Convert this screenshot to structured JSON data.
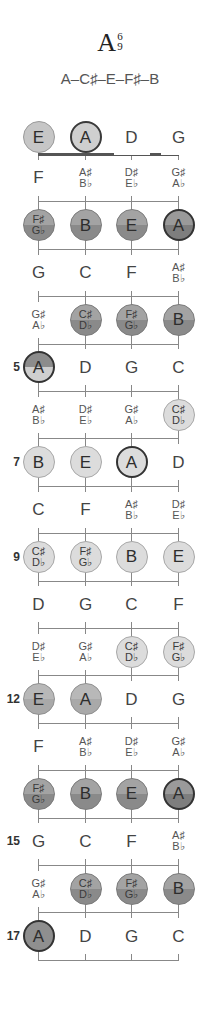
{
  "chord": {
    "root": "A",
    "ext_top": "6",
    "ext_bottom": "9",
    "notes_label": "A–C♯–E–F♯–B"
  },
  "strings": [
    "E",
    "A",
    "D",
    "G"
  ],
  "fret_numbers": [
    {
      "fret": 5,
      "label": "5"
    },
    {
      "fret": 7,
      "label": "7"
    },
    {
      "fret": 9,
      "label": "9"
    },
    {
      "fret": 12,
      "label": "12"
    },
    {
      "fret": 15,
      "label": "15"
    },
    {
      "fret": 17,
      "label": "17"
    }
  ],
  "rows": [
    {
      "fret": 0,
      "cells": [
        {
          "top": "E",
          "style": "open",
          "root": false
        },
        {
          "top": "A",
          "style": "open",
          "root": true
        },
        {
          "top": "D",
          "style": "plain"
        },
        {
          "top": "G",
          "style": "plain"
        }
      ]
    },
    {
      "fret": 1,
      "cells": [
        {
          "top": "F",
          "style": "plain"
        },
        {
          "top": "A♯",
          "bottom": "B♭",
          "style": "plain"
        },
        {
          "top": "D♯",
          "bottom": "E♭",
          "style": "plain"
        },
        {
          "top": "G♯",
          "bottom": "A♭",
          "style": "plain"
        }
      ]
    },
    {
      "fret": 2,
      "cells": [
        {
          "top": "F♯",
          "bottom": "G♭",
          "style": "dark"
        },
        {
          "top": "B",
          "style": "dark"
        },
        {
          "top": "E",
          "style": "dark"
        },
        {
          "top": "A",
          "style": "dark",
          "root": true
        }
      ]
    },
    {
      "fret": 3,
      "cells": [
        {
          "top": "G",
          "style": "plain"
        },
        {
          "top": "C",
          "style": "plain"
        },
        {
          "top": "F",
          "style": "plain"
        },
        {
          "top": "A♯",
          "bottom": "B♭",
          "style": "plain"
        }
      ]
    },
    {
      "fret": 4,
      "cells": [
        {
          "top": "G♯",
          "bottom": "A♭",
          "style": "plain"
        },
        {
          "top": "C♯",
          "bottom": "D♭",
          "style": "dark"
        },
        {
          "top": "F♯",
          "bottom": "G♭",
          "style": "dark"
        },
        {
          "top": "B",
          "style": "dark"
        }
      ]
    },
    {
      "fret": 5,
      "cells": [
        {
          "top": "A",
          "style": "mid",
          "root": true
        },
        {
          "top": "D",
          "style": "plain"
        },
        {
          "top": "G",
          "style": "plain"
        },
        {
          "top": "C",
          "style": "plain"
        }
      ]
    },
    {
      "fret": 6,
      "cells": [
        {
          "top": "A♯",
          "bottom": "B♭",
          "style": "plain"
        },
        {
          "top": "D♯",
          "bottom": "E♭",
          "style": "plain"
        },
        {
          "top": "G♯",
          "bottom": "A♭",
          "style": "plain"
        },
        {
          "top": "C♯",
          "bottom": "D♭",
          "style": "light"
        }
      ]
    },
    {
      "fret": 7,
      "cells": [
        {
          "top": "B",
          "style": "light"
        },
        {
          "top": "E",
          "style": "light"
        },
        {
          "top": "A",
          "style": "light",
          "root": true
        },
        {
          "top": "D",
          "style": "plain"
        }
      ]
    },
    {
      "fret": 8,
      "cells": [
        {
          "top": "C",
          "style": "plain"
        },
        {
          "top": "F",
          "style": "plain"
        },
        {
          "top": "A♯",
          "bottom": "B♭",
          "style": "plain"
        },
        {
          "top": "D♯",
          "bottom": "E♭",
          "style": "plain"
        }
      ]
    },
    {
      "fret": 9,
      "cells": [
        {
          "top": "C♯",
          "bottom": "D♭",
          "style": "light"
        },
        {
          "top": "F♯",
          "bottom": "G♭",
          "style": "light"
        },
        {
          "top": "B",
          "style": "light"
        },
        {
          "top": "E",
          "style": "light"
        }
      ]
    },
    {
      "fret": 10,
      "cells": [
        {
          "top": "D",
          "style": "plain"
        },
        {
          "top": "G",
          "style": "plain"
        },
        {
          "top": "C",
          "style": "plain"
        },
        {
          "top": "F",
          "style": "plain"
        }
      ]
    },
    {
      "fret": 11,
      "cells": [
        {
          "top": "D♯",
          "bottom": "E♭",
          "style": "plain"
        },
        {
          "top": "G♯",
          "bottom": "A♭",
          "style": "plain"
        },
        {
          "top": "C♯",
          "bottom": "D♭",
          "style": "light"
        },
        {
          "top": "F♯",
          "bottom": "G♭",
          "style": "light"
        }
      ]
    },
    {
      "fret": 12,
      "cells": [
        {
          "top": "E",
          "style": "pale"
        },
        {
          "top": "A",
          "style": "pale",
          "root": true
        },
        {
          "top": "D",
          "style": "plain"
        },
        {
          "top": "G",
          "style": "plain"
        }
      ]
    },
    {
      "fret": 13,
      "cells": [
        {
          "top": "F",
          "style": "plain"
        },
        {
          "top": "A♯",
          "bottom": "B♭",
          "style": "plain"
        },
        {
          "top": "D♯",
          "bottom": "E♭",
          "style": "plain"
        },
        {
          "top": "G♯",
          "bottom": "A♭",
          "style": "plain"
        }
      ]
    },
    {
      "fret": 14,
      "cells": [
        {
          "top": "F♯",
          "bottom": "G♭",
          "style": "dark"
        },
        {
          "top": "B",
          "style": "dark"
        },
        {
          "top": "E",
          "style": "dark"
        },
        {
          "top": "A",
          "style": "dark",
          "root": true
        }
      ]
    },
    {
      "fret": 15,
      "cells": [
        {
          "top": "G",
          "style": "plain"
        },
        {
          "top": "C",
          "style": "plain"
        },
        {
          "top": "F",
          "style": "plain"
        },
        {
          "top": "A♯",
          "bottom": "B♭",
          "style": "plain"
        }
      ]
    },
    {
      "fret": 16,
      "cells": [
        {
          "top": "G♯",
          "bottom": "A♭",
          "style": "plain"
        },
        {
          "top": "C♯",
          "bottom": "D♭",
          "style": "dark"
        },
        {
          "top": "F♯",
          "bottom": "G♭",
          "style": "dark"
        },
        {
          "top": "B",
          "style": "dark"
        }
      ]
    },
    {
      "fret": 17,
      "cells": [
        {
          "top": "A",
          "style": "darkest",
          "root": true
        },
        {
          "top": "D",
          "style": "plain"
        },
        {
          "top": "G",
          "style": "plain"
        },
        {
          "top": "C",
          "style": "plain"
        }
      ]
    }
  ],
  "layout": {
    "string_x": [
      38,
      85,
      131,
      178
    ],
    "open_row_y": 137,
    "nut_y": 154,
    "fret_spacing": 47.4,
    "fret_count": 17
  }
}
